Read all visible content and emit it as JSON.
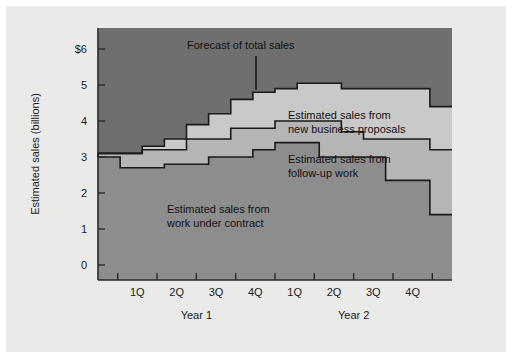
{
  "figure": {
    "background_color": "#eaeae8",
    "plot_background_color": "#8d8d8d"
  },
  "axes": {
    "y_axis_title": "Estimated sales (billions)",
    "y_tick_labels": [
      "$6",
      "5",
      "4",
      "3",
      "2",
      "1",
      "0"
    ],
    "y_tick_values": [
      6,
      5,
      4,
      3,
      2,
      1,
      0
    ],
    "x_tick_labels": [
      "1Q",
      "2Q",
      "3Q",
      "4Q",
      "1Q",
      "2Q",
      "3Q",
      "4Q"
    ],
    "x_group_labels": [
      "Year 1",
      "Year 2"
    ]
  },
  "annotations": [
    {
      "id": "total",
      "line1": "Forecast of total sales",
      "line2": ""
    },
    {
      "id": "new-business",
      "line1": "Estimated sales from",
      "line2": "new business proposals"
    },
    {
      "id": "follow-up",
      "line1": "Estimated sales from",
      "line2": "follow-up work"
    },
    {
      "id": "contract",
      "line1": "Estimated sales from",
      "line2": "work under contract"
    }
  ],
  "colors": {
    "band_contract": "#8d8d8d",
    "band_followup": "#b5b5b5",
    "band_new_business": "#c9c9c9",
    "band_outside": "#6f6f6f",
    "line": "#1a1a1a",
    "text": "#1c1c1c"
  },
  "chart_data": {
    "type": "area",
    "subtype": "stacked-step-area",
    "title": "Forecast of total sales",
    "xlabel": "",
    "ylabel": "Estimated sales (billions)",
    "ylim": [
      0,
      6.3
    ],
    "yticks": [
      0,
      1,
      2,
      3,
      4,
      5,
      6
    ],
    "grid": false,
    "legend_position": "inline-annotations",
    "x": [
      "Year 1 1Q",
      "Year 1 2Q",
      "Year 1 3Q",
      "Year 1 4Q",
      "Year 2 1Q",
      "Year 2 2Q",
      "Year 2 3Q",
      "Year 2 4Q"
    ],
    "x_subdivisions_per_quarter": 2,
    "note": "Each quarter is drawn as two half-quarter steps; values below are the cumulative (stacked) top edges of each band in billions of dollars, read at each half-quarter step from the start of Year 1 1Q to the end of Year 2 4Q.",
    "steps_x_fraction": [
      0.0,
      0.0625,
      0.125,
      0.1875,
      0.25,
      0.3125,
      0.375,
      0.4375,
      0.5,
      0.5625,
      0.625,
      0.6875,
      0.75,
      0.8125,
      0.875,
      0.9375,
      1.0
    ],
    "series": [
      {
        "name": "Estimated sales from work under contract",
        "color": "#8d8d8d",
        "cumulative_values": [
          3.0,
          3.0,
          2.7,
          2.7,
          2.8,
          2.8,
          3.0,
          3.0,
          3.2,
          3.4,
          3.4,
          3.0,
          3.0,
          3.0,
          2.35,
          2.35,
          1.4,
          1.4
        ]
      },
      {
        "name": "Estimated sales from follow-up work",
        "color": "#b5b5b5",
        "cumulative_values": [
          3.0,
          3.1,
          3.1,
          3.2,
          3.2,
          3.5,
          3.5,
          3.8,
          3.8,
          4.0,
          4.0,
          4.0,
          3.7,
          3.5,
          3.5,
          3.5,
          3.2,
          3.2
        ]
      },
      {
        "name": "Estimated sales from new business proposals",
        "color": "#c9c9c9",
        "cumulative_values": [
          3.0,
          3.1,
          3.1,
          3.3,
          3.5,
          3.9,
          4.2,
          4.6,
          4.8,
          4.9,
          5.05,
          5.05,
          4.9,
          4.9,
          4.9,
          4.9,
          4.4,
          4.4
        ]
      }
    ]
  }
}
